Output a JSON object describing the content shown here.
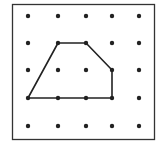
{
  "diagram": {
    "type": "geoboard-dot-grid",
    "grid": {
      "rows": 5,
      "cols": 5,
      "x": [
        28,
        58,
        86,
        112,
        139
      ],
      "y": [
        16,
        43,
        70,
        98,
        126
      ],
      "dot_color": "#222222",
      "dot_radius": 2.2
    },
    "frame": {
      "x": 12,
      "y": 4,
      "width": 142,
      "height": 135,
      "stroke": "#333333"
    },
    "polygon": {
      "shape": "pentagon",
      "vertices_grid": [
        [
          1,
          1
        ],
        [
          2,
          1
        ],
        [
          3,
          2
        ],
        [
          3,
          3
        ],
        [
          0,
          3
        ]
      ],
      "stroke": "#222222",
      "stroke_width": 1.6
    }
  }
}
